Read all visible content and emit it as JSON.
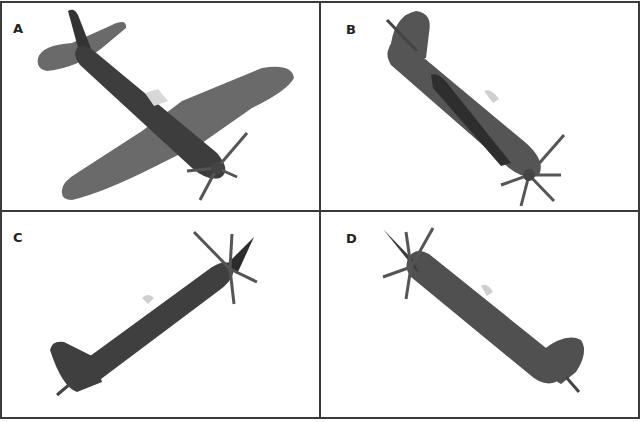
{
  "figure": {
    "panels": [
      {
        "id": "A",
        "label": "A",
        "description": "aircraft viewed from below-front, wings spread, nose down-right"
      },
      {
        "id": "B",
        "label": "B",
        "description": "aircraft diving steeply, nose lower-right, viewed from side-below"
      },
      {
        "id": "C",
        "label": "C",
        "description": "aircraft climbing, nose upper-right, side view"
      },
      {
        "id": "D",
        "label": "D",
        "description": "aircraft climbing, nose upper-left, side view"
      }
    ],
    "colors": {
      "border": "#3a3a3a",
      "aircraft_body": "#4a4a4a",
      "aircraft_wing": "#6a6a6a",
      "propeller": "#555555",
      "background": "#ffffff"
    }
  }
}
